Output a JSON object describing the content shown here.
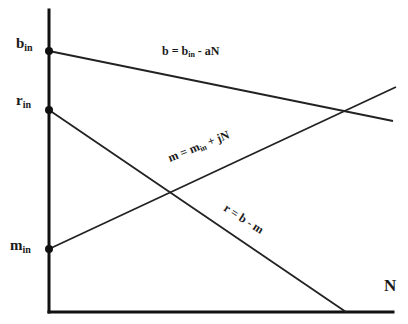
{
  "diagram": {
    "axis_labels": {
      "x": "N"
    },
    "intercepts": [
      {
        "id": "b_in",
        "base": "b",
        "sub": "in"
      },
      {
        "id": "r_in",
        "base": "r",
        "sub": "in"
      },
      {
        "id": "m_in",
        "base": "m",
        "sub": "in"
      }
    ],
    "lines": [
      {
        "id": "b",
        "equation": {
          "lhs": "b = b",
          "sub": "in",
          "rhs": " - aN"
        },
        "slope": "negative"
      },
      {
        "id": "m",
        "equation": {
          "lhs": "m = m",
          "sub": "in",
          "rhs": " + jN"
        },
        "slope": "positive"
      },
      {
        "id": "r",
        "equation": {
          "lhs": "r = b - m",
          "sub": "",
          "rhs": ""
        },
        "slope": "negative"
      }
    ],
    "colors": {
      "line": "#222222",
      "background": "#ffffff"
    }
  }
}
